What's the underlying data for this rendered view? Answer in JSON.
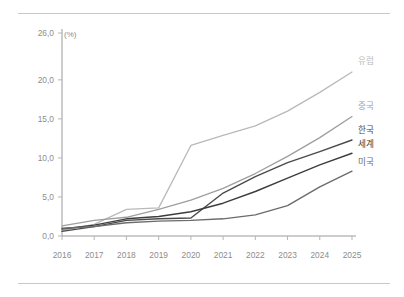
{
  "figure": {
    "background": "#ffffff",
    "top_rule_color": "#c9c9c9",
    "bottom_rule_color": "#c9c9c9"
  },
  "chart_data": {
    "type": "line",
    "title": "",
    "subtitle": "",
    "xlabel": "",
    "ylabel": "",
    "unit_label": "(%)",
    "grid": false,
    "legend_position": "right-inline",
    "categories": [
      "2016",
      "2017",
      "2018",
      "2019",
      "2020",
      "2021",
      "2022",
      "2023",
      "2024",
      "2025"
    ],
    "x": [
      2016,
      2017,
      2018,
      2019,
      2020,
      2021,
      2022,
      2023,
      2024,
      2025
    ],
    "xlim": [
      2016,
      2025
    ],
    "ylim": [
      0,
      26
    ],
    "yticks": [
      0,
      5,
      10,
      15,
      20,
      26
    ],
    "ytick_labels": [
      "0,0",
      "5,0",
      "10,0",
      "15,0",
      "20,0",
      "26,0"
    ],
    "xtick_labels": [
      "2016",
      "2017",
      "2018",
      "2019",
      "2020",
      "2021",
      "2022",
      "2023",
      "2024",
      "2025"
    ],
    "series": [
      {
        "name": "유럽",
        "label": "유럽",
        "color": "#b9b9b9",
        "width": 1.3,
        "values": [
          0.7,
          1.5,
          3.4,
          3.6,
          11.6,
          12.9,
          14.1,
          16.0,
          18.4,
          21.0
        ],
        "label_value": "21,0"
      },
      {
        "name": "중국",
        "label": "중국",
        "color": "#9e9e9e",
        "width": 1.3,
        "values": [
          1.3,
          2.0,
          2.4,
          3.4,
          4.6,
          6.1,
          8.0,
          10.2,
          12.6,
          15.3
        ],
        "label_value": "15,3"
      },
      {
        "name": "한국",
        "label": "한국",
        "color": "#4a4a4a",
        "width": 1.4,
        "values": [
          0.6,
          1.2,
          2.0,
          2.2,
          2.3,
          5.5,
          7.6,
          9.4,
          10.8,
          12.3
        ],
        "label_value": "12,3"
      },
      {
        "name": "세계",
        "label": "세계",
        "color": "#3d3d3d",
        "width": 1.4,
        "values": [
          0.9,
          1.4,
          2.2,
          2.5,
          3.1,
          4.2,
          5.7,
          7.4,
          9.1,
          10.6
        ],
        "label_value": "10,6"
      },
      {
        "name": "미국",
        "label": "미국",
        "color": "#6b6b6b",
        "width": 1.4,
        "values": [
          1.0,
          1.2,
          1.7,
          1.9,
          2.0,
          2.2,
          2.7,
          3.9,
          6.3,
          8.3
        ],
        "label_value": "8,3"
      }
    ]
  }
}
